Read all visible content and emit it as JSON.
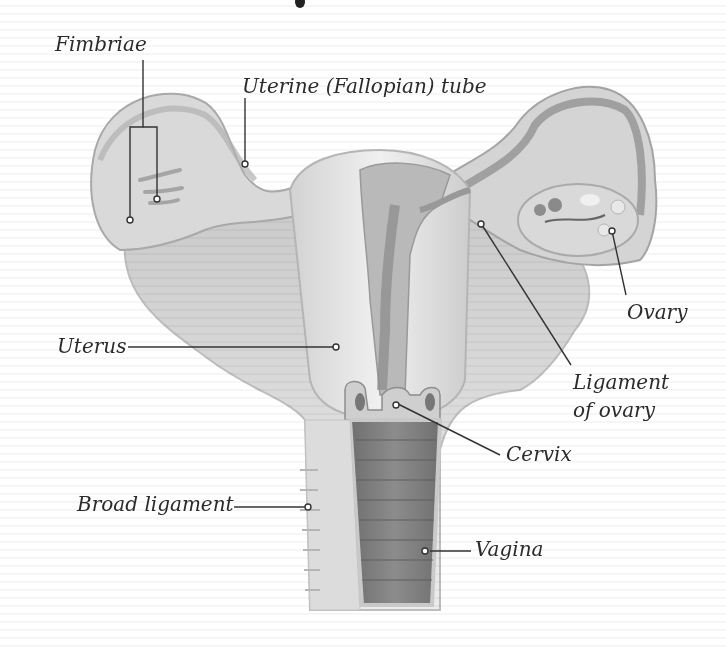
{
  "diagram": {
    "colors": {
      "background": "#ffffff",
      "tissue_light": "#e6e6e6",
      "tissue_mid": "#c4c4c4",
      "tissue_dark": "#8a8a8a",
      "vaginal_canal": "#7d7d7d",
      "leader_line": "#333333",
      "label_text": "#2b2b2b"
    },
    "labels": {
      "fimbriae": "Fimbriae",
      "uterine_tube": "Uterine (Fallopian) tube",
      "ovary": "Ovary",
      "uterus": "Uterus",
      "ligament_of_ovary_line1": "Ligament",
      "ligament_of_ovary_line2": "of ovary",
      "cervix": "Cervix",
      "broad_ligament": "Broad ligament",
      "vagina": "Vagina"
    }
  }
}
